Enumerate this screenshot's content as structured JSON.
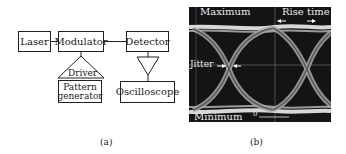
{
  "panel_a": {
    "caption": "(a)",
    "blocks": {
      "laser": "Laser",
      "modulator": "Modulator",
      "detector": "Detector",
      "driver": "Driver",
      "pattern_generator_line1": "Pattern",
      "pattern_generator_line2": "generator",
      "oscilloscope": "Oscilloscope"
    }
  },
  "panel_b": {
    "caption": "(b)",
    "labels": {
      "maximum": "Maximum",
      "rise_time": "Rise time",
      "jitter": "Jitter",
      "minimum": "Minimum",
      "zero": "0"
    },
    "colors": {
      "background": "#141414",
      "trace": "#b8b8b8",
      "grid": "#9a9a9a"
    }
  }
}
